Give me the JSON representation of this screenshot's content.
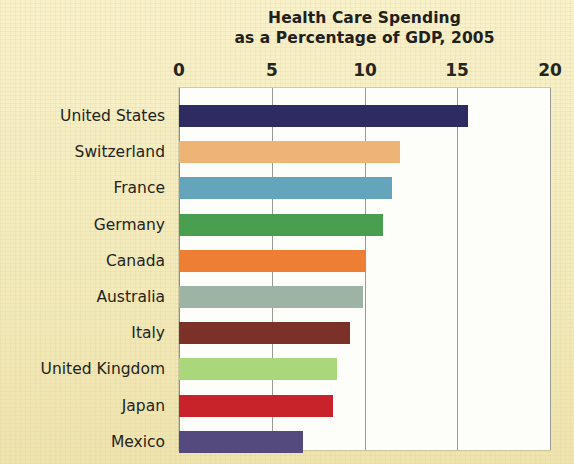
{
  "chart_data": {
    "type": "bar",
    "orientation": "horizontal",
    "title": "Health Care Spending as a Percentage of GDP, 2005",
    "title_lines": [
      "Health Care Spending",
      "as a Percentage of GDP, 2005"
    ],
    "xlabel": "",
    "ylabel": "",
    "xlim": [
      0,
      20
    ],
    "xticks": [
      0,
      5,
      10,
      15,
      20
    ],
    "xtick_labels": [
      "0",
      "5",
      "10",
      "15",
      "20"
    ],
    "grid": "vertical",
    "legend": "none",
    "categories": [
      "United States",
      "Switzerland",
      "France",
      "Germany",
      "Canada",
      "Australia",
      "Italy",
      "United Kingdom",
      "Japan",
      "Mexico"
    ],
    "values": [
      15.6,
      11.9,
      11.5,
      11.0,
      10.1,
      9.9,
      9.2,
      8.5,
      8.3,
      6.7
    ],
    "colors": [
      "#2e2b63",
      "#eeb475",
      "#64a5bb",
      "#4a9e4f",
      "#ef7e35",
      "#9db3a3",
      "#7b3128",
      "#aad67c",
      "#c8232a",
      "#544a7d"
    ],
    "bars": [
      {
        "label": "United States",
        "value": 15.6,
        "color": "#2e2b63"
      },
      {
        "label": "Switzerland",
        "value": 11.9,
        "color": "#eeb475"
      },
      {
        "label": "France",
        "value": 11.5,
        "color": "#64a5bb"
      },
      {
        "label": "Germany",
        "value": 11.0,
        "color": "#4a9e4f"
      },
      {
        "label": "Canada",
        "value": 10.1,
        "color": "#ef7e35"
      },
      {
        "label": "Australia",
        "value": 9.9,
        "color": "#9db3a3"
      },
      {
        "label": "Italy",
        "value": 9.2,
        "color": "#7b3128"
      },
      {
        "label": "United Kingdom",
        "value": 8.5,
        "color": "#aad67c"
      },
      {
        "label": "Japan",
        "value": 8.3,
        "color": "#c8232a"
      },
      {
        "label": "Mexico",
        "value": 6.7,
        "color": "#544a7d"
      }
    ]
  },
  "page": {
    "background_color": "#f5edc0",
    "plot_background_color": "#fdfdfa",
    "gridline_color": "#9b9a92",
    "text_color": "#23231d"
  }
}
